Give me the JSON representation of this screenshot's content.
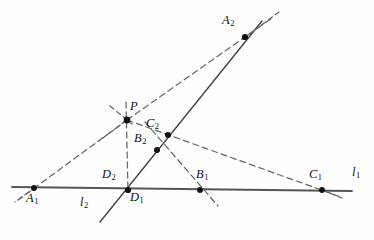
{
  "figure": {
    "type": "geometry-diagram",
    "background": "#fefefe",
    "stroke_solid": "#555555",
    "stroke_dashed": "#666666",
    "point_color": "#111111",
    "label_color": "#111111",
    "width": 374,
    "height": 240
  },
  "labels": {
    "A1": {
      "base": "A",
      "sub": "1"
    },
    "A2": {
      "base": "A",
      "sub": "2"
    },
    "B1": {
      "base": "B",
      "sub": "1"
    },
    "B2": {
      "base": "B",
      "sub": "2"
    },
    "C1": {
      "base": "C",
      "sub": "1"
    },
    "C2": {
      "base": "C",
      "sub": "2"
    },
    "D1": {
      "base": "D",
      "sub": "1"
    },
    "D2": {
      "base": "D",
      "sub": "2"
    },
    "P": {
      "base": "P",
      "sub": ""
    },
    "l1": {
      "base": "l",
      "sub": "1"
    },
    "l2": {
      "base": "l",
      "sub": "2"
    }
  },
  "points": {
    "A1": {
      "x": 34,
      "y": 188,
      "label_x": 28,
      "label_y": 192
    },
    "A2": {
      "x": 245,
      "y": 37,
      "label_x": 224,
      "label_y": 16
    },
    "B1": {
      "x": 200,
      "y": 190,
      "label_x": 198,
      "label_y": 170
    },
    "B2": {
      "x": 157,
      "y": 150,
      "label_x": 136,
      "label_y": 134
    },
    "C1": {
      "x": 322,
      "y": 190,
      "label_x": 311,
      "label_y": 170
    },
    "C2": {
      "x": 168,
      "y": 135,
      "label_x": 148,
      "label_y": 119
    },
    "D1": {
      "x": 128,
      "y": 190,
      "label_x": 130,
      "label_y": 192
    },
    "D2": {
      "x": 128,
      "y": 190,
      "label_x": 104,
      "label_y": 170
    },
    "P": {
      "x": 127,
      "y": 120,
      "label_x": 130,
      "label_y": 101
    }
  },
  "line_labels": {
    "l1": {
      "x": 352,
      "y": 168
    },
    "l2": {
      "x": 82,
      "y": 198
    }
  },
  "segments": {
    "line_l1": {
      "x1": 12,
      "y1": 187,
      "x2": 352,
      "y2": 191,
      "style": "solid"
    },
    "line_l2": {
      "x1": 100,
      "y1": 222,
      "x2": 262,
      "y2": 21,
      "style": "solid"
    },
    "pencil_P_A1": {
      "x1": 127,
      "y1": 120,
      "x2": 18,
      "y2": 200,
      "style": "dashed"
    },
    "pencil_P_A2": {
      "x1": 127,
      "y1": 120,
      "x2": 272,
      "y2": 18,
      "style": "dashed"
    },
    "pencil_P_C1": {
      "x1": 127,
      "y1": 120,
      "x2": 338,
      "y2": 196,
      "style": "dashed"
    },
    "pencil_P_D1": {
      "x1": 126,
      "y1": 102,
      "x2": 128,
      "y2": 192,
      "style": "dashed"
    },
    "pencil_P_stub": {
      "x1": 113,
      "y1": 108,
      "x2": 140,
      "y2": 130,
      "style": "dashed"
    },
    "pencil_P_left": {
      "x1": 127,
      "y1": 120,
      "x2": 100,
      "y2": 140,
      "style": "dashed"
    },
    "chord_B2_B1": {
      "x1": 145,
      "y1": 122,
      "x2": 218,
      "y2": 206,
      "style": "dashed"
    },
    "tail_A2": {
      "x1": 245,
      "y1": 37,
      "x2": 278,
      "y2": 12,
      "style": "dashed"
    },
    "tail_C1": {
      "x1": 322,
      "y1": 190,
      "x2": 340,
      "y2": 197,
      "style": "dashed"
    },
    "tail_A1": {
      "x1": 34,
      "y1": 188,
      "x2": 16,
      "y2": 201,
      "style": "dashed"
    }
  }
}
